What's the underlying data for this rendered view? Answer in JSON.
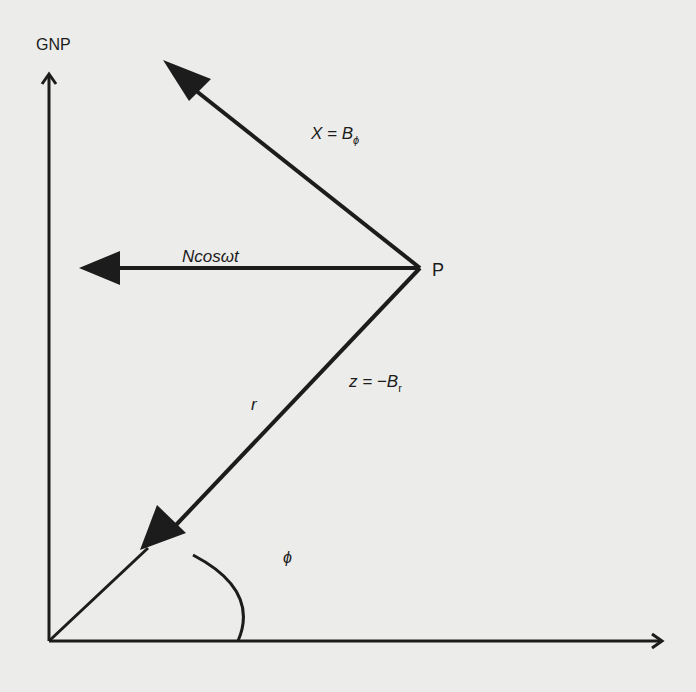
{
  "diagram": {
    "colors": {
      "ink": "#1c1c1c",
      "background": "#ececea"
    },
    "labels": {
      "axis_vertical": "GNP",
      "point": "P",
      "x_component_lhs": "X = B",
      "x_component_sub": "ϕ",
      "n_component": "Ncosωt",
      "z_component_lhs": "z = −B",
      "z_component_sub": "r",
      "radius": "r",
      "angle": "ϕ"
    },
    "geometry": {
      "origin": [
        49,
        641
      ],
      "point_P": [
        420,
        268
      ],
      "vertical_axis_end": [
        49,
        73
      ],
      "horizontal_axis_end": [
        662,
        641
      ],
      "x_arrow_tip": [
        163,
        60
      ],
      "n_arrow_tip": [
        79,
        268
      ],
      "r_arrow_head_tip": [
        140,
        572
      ]
    },
    "arrows": [
      {
        "name": "X",
        "from": "P",
        "direction": "up-left",
        "label": "X = Bϕ"
      },
      {
        "name": "Ncosωt",
        "from": "P",
        "direction": "left",
        "label": "Ncosωt"
      },
      {
        "name": "z",
        "from": "P",
        "direction": "down-left toward origin",
        "label": "z = −Br"
      }
    ]
  }
}
